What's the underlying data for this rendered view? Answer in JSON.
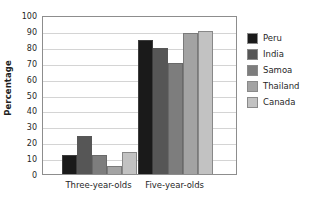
{
  "chart_data": {
    "type": "bar",
    "title": "",
    "xlabel": "",
    "ylabel": "Percentage",
    "categories": [
      "Three-year-olds",
      "Five-year-olds"
    ],
    "series": [
      {
        "name": "Peru",
        "color": "#1a1a1a",
        "values": [
          12,
          84
        ]
      },
      {
        "name": "India",
        "color": "#565656",
        "values": [
          24,
          79
        ]
      },
      {
        "name": "Samoa",
        "color": "#7d7d7d",
        "values": [
          12,
          70
        ]
      },
      {
        "name": "Thailand",
        "color": "#a3a3a3",
        "values": [
          5,
          89
        ]
      },
      {
        "name": "Canada",
        "color": "#c2c2c2",
        "values": [
          14,
          90
        ]
      }
    ],
    "ylim": [
      0,
      100
    ],
    "yticks": [
      0,
      10,
      20,
      30,
      40,
      50,
      60,
      70,
      80,
      90,
      100
    ],
    "ytick_labels": [
      "0",
      "10",
      "20",
      "30",
      "40",
      "50",
      "60",
      "70",
      "80",
      "90",
      "100"
    ],
    "grid": "horizontal",
    "legend_position": "right-inside",
    "frame_color": "#8d8d8d",
    "gridline_color": "#d4d4d4",
    "background": "#ffffff"
  }
}
